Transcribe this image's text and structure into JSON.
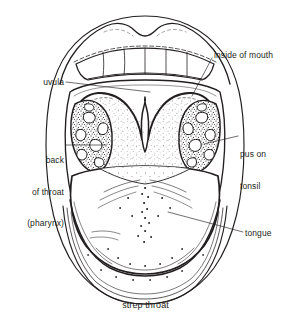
{
  "figure": {
    "title": "strep throat",
    "background_color": "#ffffff",
    "ink_color": "#231f20"
  },
  "caption": {
    "text": "strep throat"
  },
  "labels": [
    {
      "id": "uvula",
      "text": "uvula",
      "lines": [
        "uvula"
      ],
      "align": "right",
      "leader_from": [
        64,
        82
      ],
      "leader_to": [
        150,
        92
      ]
    },
    {
      "id": "back-of-throat",
      "text": "back of throat (pharynx)",
      "lines": [
        "back",
        "of throat",
        "(pharynx)"
      ],
      "align": "right",
      "leader_from": [
        66,
        145
      ],
      "leader_to": [
        106,
        145
      ]
    },
    {
      "id": "inside-of-mouth",
      "text": "inside of mouth",
      "lines": [
        "inside of mouth"
      ],
      "align": "left",
      "leader_from": [
        212,
        58
      ],
      "leader_to": [
        192,
        96
      ]
    },
    {
      "id": "pus-on-tonsil",
      "text": "pus on tonsil",
      "lines": [
        "pus on",
        "tonsil"
      ],
      "align": "left",
      "leader_from": [
        238,
        136
      ],
      "leader_to": [
        204,
        144
      ]
    },
    {
      "id": "tongue",
      "text": "tongue",
      "lines": [
        "tongue"
      ],
      "align": "left",
      "leader_from": [
        243,
        232
      ],
      "leader_to": [
        168,
        212
      ]
    }
  ],
  "anatomy": {
    "parts": [
      "upper lip",
      "upper teeth",
      "soft palate",
      "uvula",
      "left tonsil",
      "right tonsil",
      "pharynx",
      "tongue",
      "lower lip"
    ]
  }
}
